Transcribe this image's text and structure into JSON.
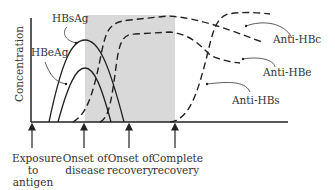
{
  "diagram": {
    "y_axis_label": "Concentration",
    "shaded_region": {
      "from": "Onset of disease",
      "to": "Complete recovery",
      "color": "#d9d9d9"
    },
    "curves": [
      {
        "name": "HBsAg",
        "style": "solid"
      },
      {
        "name": "HBeAg",
        "style": "solid"
      },
      {
        "name": "Anti-HBc",
        "style": "dashed"
      },
      {
        "name": "Anti-HBe",
        "style": "dashed"
      },
      {
        "name": "Anti-HBs",
        "style": "dashed"
      }
    ],
    "timeline": [
      {
        "line1": "Exposure",
        "line2": "to",
        "line3": "antigen"
      },
      {
        "line1": "Onset of",
        "line2": "disease"
      },
      {
        "line1": "Onset of",
        "line2": "recovery"
      },
      {
        "line1": "Complete",
        "line2": "recovery"
      }
    ]
  }
}
